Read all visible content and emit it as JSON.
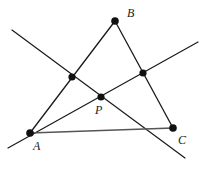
{
  "figure": {
    "type": "geometry-diagram",
    "width": 209,
    "height": 171,
    "background_color": "#ffffff",
    "stroke_color": "#1a1a1a",
    "point_color": "#111111",
    "segment_ac_color": "#555555",
    "stroke_width": 1.2,
    "point_radius": 3.4
  },
  "points": [
    {
      "id": "A",
      "label": "A",
      "x": 30,
      "y": 133,
      "label_x": 33,
      "label_y": 140,
      "radius": 3.8
    },
    {
      "id": "B",
      "label": "B",
      "x": 115,
      "y": 21,
      "label_x": 127,
      "label_y": 7,
      "radius": 3.8
    },
    {
      "id": "C",
      "label": "C",
      "x": 173,
      "y": 128,
      "label_x": 178,
      "label_y": 134,
      "radius": 3.8
    },
    {
      "id": "P",
      "label": "P",
      "x": 101,
      "y": 97,
      "label_x": 95,
      "label_y": 104,
      "radius": 3.6
    },
    {
      "id": "M1",
      "label": "",
      "x": 72,
      "y": 77,
      "label_x": 0,
      "label_y": 0,
      "radius": 3.6
    },
    {
      "id": "M2",
      "label": "",
      "x": 143,
      "y": 73,
      "label_x": 0,
      "label_y": 0,
      "radius": 3.6
    }
  ],
  "segments": [
    {
      "id": "side-AB",
      "from_x": 30,
      "from_y": 133,
      "to_x": 115,
      "to_y": 21,
      "color": "#1a1a1a",
      "width": 1.3
    },
    {
      "id": "side-BC",
      "from_x": 115,
      "from_y": 21,
      "to_x": 173,
      "to_y": 128,
      "color": "#1a1a1a",
      "width": 1.3
    },
    {
      "id": "side-AC",
      "from_x": 30,
      "from_y": 133,
      "to_x": 173,
      "to_y": 128,
      "color": "#555555",
      "width": 1.6
    },
    {
      "id": "transversal-1",
      "from_x": 12,
      "from_y": 30,
      "to_x": 185,
      "to_y": 158,
      "color": "#1a1a1a",
      "width": 1.2
    },
    {
      "id": "transversal-2",
      "from_x": 8,
      "from_y": 148,
      "to_x": 198,
      "to_y": 42,
      "color": "#1a1a1a",
      "width": 1.2
    }
  ],
  "labels": {
    "A": "A",
    "B": "B",
    "C": "C",
    "P": "P"
  }
}
